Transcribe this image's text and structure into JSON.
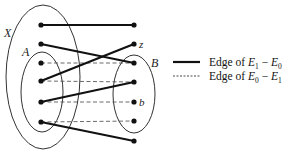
{
  "diagram": {
    "sets": {
      "X": {
        "label": "X",
        "cx": 43,
        "cy": 77,
        "rx": 37,
        "ry": 72,
        "label_pos": [
          4,
          37
        ]
      },
      "A": {
        "label": "A",
        "cx": 42,
        "cy": 92,
        "rx": 21,
        "ry": 40,
        "label_pos": [
          22,
          56
        ]
      },
      "B": {
        "label": "B",
        "cx": 134,
        "cy": 94,
        "rx": 21,
        "ry": 39,
        "label_pos": [
          151,
          67
        ]
      }
    },
    "left_nodes": [
      {
        "id": "L1",
        "x": 41,
        "y": 25
      },
      {
        "id": "L2",
        "x": 41,
        "y": 44
      },
      {
        "id": "L3",
        "x": 41,
        "y": 63
      },
      {
        "id": "L4",
        "x": 41,
        "y": 81
      },
      {
        "id": "L5",
        "x": 41,
        "y": 102
      },
      {
        "id": "L6",
        "x": 41,
        "y": 122
      }
    ],
    "right_nodes": [
      {
        "id": "R1",
        "x": 134,
        "y": 25,
        "label": ""
      },
      {
        "id": "R2",
        "x": 134,
        "y": 44,
        "label": "z"
      },
      {
        "id": "R3",
        "x": 134,
        "y": 63,
        "label": ""
      },
      {
        "id": "R4",
        "x": 134,
        "y": 82,
        "label": ""
      },
      {
        "id": "R5",
        "x": 134,
        "y": 102,
        "label": "b"
      },
      {
        "id": "R6",
        "x": 134,
        "y": 121,
        "label": ""
      },
      {
        "id": "R7",
        "x": 134,
        "y": 141,
        "label": ""
      }
    ],
    "edges_solid": [
      [
        "L1",
        "R1"
      ],
      [
        "L2",
        "R3"
      ],
      [
        "L4",
        "R2"
      ],
      [
        "L5",
        "R4"
      ],
      [
        "L6",
        "R7"
      ]
    ],
    "edges_dashed": [
      [
        "L3",
        "R3"
      ],
      [
        "L4",
        "R4"
      ],
      [
        "L5",
        "R5"
      ],
      [
        "L6",
        "R6"
      ]
    ],
    "legend": {
      "solid": {
        "prefix": "Edge of ",
        "a": "E",
        "a_sub": "1",
        "op": " − ",
        "b": "E",
        "b_sub": "0"
      },
      "dashed": {
        "prefix": "Edge of ",
        "a": "E",
        "a_sub": "0",
        "op": " − ",
        "b": "E",
        "b_sub": "1"
      }
    },
    "colors": {
      "stroke": "#111111",
      "ellipse": "#333333"
    }
  }
}
